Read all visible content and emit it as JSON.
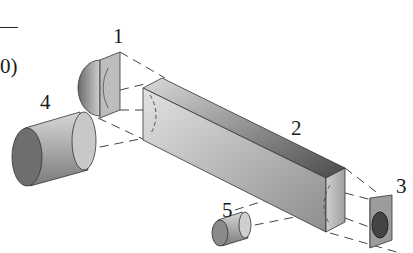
{
  "diagram": {
    "type": "exploded-assembly",
    "partial_label_left": "0)",
    "parts": [
      {
        "id": "1",
        "label": "1",
        "shape": "half-cylinder cap with square plate"
      },
      {
        "id": "2",
        "label": "2",
        "shape": "rectangular bar"
      },
      {
        "id": "3",
        "label": "3",
        "shape": "half-cylinder cap with bore"
      },
      {
        "id": "4",
        "label": "4",
        "shape": "cylinder"
      },
      {
        "id": "5",
        "label": "5",
        "shape": "small cylinder"
      }
    ],
    "colors": {
      "shade_dark": "#555555",
      "shade_mid": "#9a9a9a",
      "shade_light": "#d6d6d6",
      "outline": "#333333",
      "dash": "#444444"
    }
  }
}
